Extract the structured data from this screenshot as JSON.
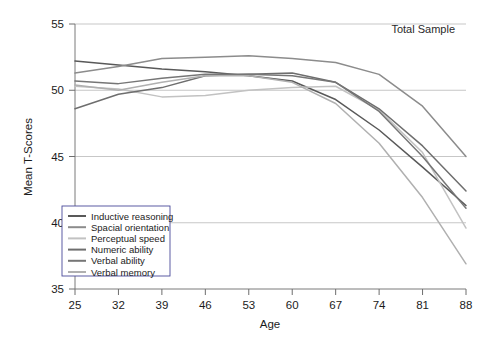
{
  "chart_data": {
    "type": "line",
    "title": "",
    "annotation": "Total Sample",
    "xlabel": "Age",
    "ylabel": "Mean T-Scores",
    "x": [
      25,
      32,
      39,
      46,
      53,
      60,
      67,
      74,
      81,
      88
    ],
    "categories": [
      "25",
      "32",
      "39",
      "46",
      "53",
      "60",
      "67",
      "74",
      "81",
      "88"
    ],
    "xlim": [
      25,
      88
    ],
    "ylim": [
      35,
      55
    ],
    "yticks": [
      35,
      40,
      45,
      50,
      55
    ],
    "ytick_labels": [
      "35",
      "40",
      "45",
      "50",
      "55"
    ],
    "grid": true,
    "grid_axis": "y",
    "legend_position": "lower-left",
    "series": [
      {
        "name": "Inductive reasoning",
        "color": "#595959",
        "values": [
          52.2,
          51.9,
          51.6,
          51.4,
          51.1,
          50.7,
          49.3,
          47.0,
          44.2,
          41.3
        ]
      },
      {
        "name": "Spacial orientation",
        "color": "#8c8c8c",
        "values": [
          51.3,
          51.8,
          52.4,
          52.5,
          52.6,
          52.4,
          52.1,
          51.2,
          48.8,
          45.0
        ]
      },
      {
        "name": "Perceptual speed",
        "color": "#c2c2c2",
        "values": [
          50.3,
          50.1,
          49.5,
          49.6,
          50.0,
          50.2,
          50.3,
          48.5,
          45.3,
          39.6
        ]
      },
      {
        "name": "Numeric ability",
        "color": "#6e6e6e",
        "values": [
          48.6,
          49.7,
          50.2,
          51.1,
          51.2,
          51.3,
          50.6,
          48.6,
          45.8,
          42.4
        ]
      },
      {
        "name": "Verbal ability",
        "color": "#767676",
        "values": [
          50.7,
          50.5,
          50.9,
          51.2,
          51.2,
          51.1,
          50.6,
          48.4,
          45.0,
          41.1
        ]
      },
      {
        "name": "Verbal memory",
        "color": "#b0b0b0",
        "values": [
          50.4,
          50.0,
          50.6,
          51.1,
          51.1,
          50.6,
          49.0,
          46.0,
          41.9,
          36.9
        ]
      }
    ]
  },
  "legend": {
    "items": [
      {
        "label": "Inductive reasoning"
      },
      {
        "label": "Spacial orientation"
      },
      {
        "label": "Perceptual speed"
      },
      {
        "label": "Numeric ability"
      },
      {
        "label": "Verbal ability"
      },
      {
        "label": "Verbal memory"
      }
    ]
  }
}
